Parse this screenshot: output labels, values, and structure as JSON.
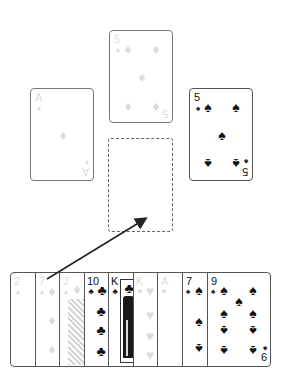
{
  "table": {
    "foundation_top": {
      "rank": "5",
      "suit": "diamonds",
      "suit_glyph": "♦",
      "state": "faded"
    },
    "foundation_left": {
      "rank": "A",
      "suit": "diamonds",
      "suit_glyph": "♦",
      "state": "faded"
    },
    "foundation_right": {
      "rank": "5",
      "suit": "spades",
      "suit_glyph": "♠",
      "state": "normal"
    },
    "empty_slot": {
      "label": ""
    }
  },
  "hand": [
    {
      "rank": "2",
      "suit_glyph": "♦",
      "state": "faded"
    },
    {
      "rank": "7",
      "suit_glyph": "♦",
      "state": "faded"
    },
    {
      "rank": "J",
      "suit_glyph": "♦",
      "state": "faded"
    },
    {
      "rank": "10",
      "suit_glyph": "♣",
      "state": "normal"
    },
    {
      "rank": "K",
      "suit_glyph": "♣",
      "state": "normal"
    },
    {
      "rank": "K",
      "suit_glyph": "♥",
      "state": "faded"
    },
    {
      "rank": "A",
      "suit_glyph": "♥",
      "state": "faded"
    },
    {
      "rank": "7",
      "suit_glyph": "♠",
      "state": "normal"
    },
    {
      "rank": "9",
      "suit_glyph": "♠",
      "state": "normal",
      "bottom_rank": "6"
    }
  ],
  "move_arrow": {
    "from": "hand card 7♦",
    "to": "empty slot"
  },
  "colors": {
    "ink": "#111111",
    "faded": "#9a9a9a",
    "border": "#555555"
  }
}
